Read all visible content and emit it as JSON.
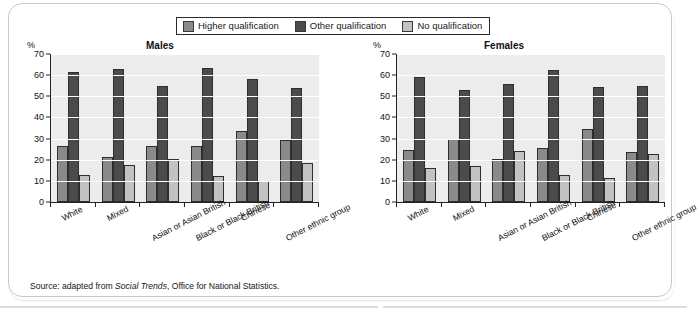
{
  "legend": {
    "items": [
      {
        "label": "Higher qualification",
        "color": "#8a8a8a",
        "key": "higher"
      },
      {
        "label": "Other qualification",
        "color": "#4b4b4b",
        "key": "other"
      },
      {
        "label": "No qualification",
        "color": "#c2c2c2",
        "key": "none"
      }
    ]
  },
  "axis": {
    "unit": "%",
    "ticks": [
      "70",
      "60",
      "50",
      "40",
      "30",
      "20",
      "10",
      "0"
    ]
  },
  "panels": [
    {
      "title": "Males",
      "unit": "%"
    },
    {
      "title": "Females",
      "unit": "%"
    }
  ],
  "source": {
    "prefix": "Source: adapted from ",
    "italic": "Social Trends",
    "suffix": ", Office for National Statistics."
  },
  "chart_data": {
    "type": "bar",
    "xlabel": "",
    "ylabel": "%",
    "ylim": [
      0,
      70
    ],
    "yticks": [
      0,
      10,
      20,
      30,
      40,
      50,
      60,
      70
    ],
    "grid": true,
    "legend_position": "top-center",
    "categories": [
      "White",
      "Mixed",
      "Asian or Asian British",
      "Black or Black British",
      "Chinese",
      "Other ethnic group"
    ],
    "panels": [
      {
        "name": "Males",
        "series": [
          {
            "name": "Higher qualification",
            "color": "#8a8a8a",
            "values": [
              26.5,
              21.5,
              26.5,
              26.5,
              33.5,
              29.5
            ]
          },
          {
            "name": "Other qualification",
            "color": "#4b4b4b",
            "values": [
              61.5,
              63.0,
              55.0,
              63.5,
              58.0,
              54.0
            ]
          },
          {
            "name": "No qualification",
            "color": "#c2c2c2",
            "values": [
              13.0,
              17.5,
              20.5,
              12.5,
              10.0,
              18.5
            ]
          }
        ]
      },
      {
        "name": "Females",
        "series": [
          {
            "name": "Higher qualification",
            "color": "#8a8a8a",
            "values": [
              24.8,
              30.0,
              20.3,
              25.5,
              34.5,
              23.8
            ]
          },
          {
            "name": "Other qualification",
            "color": "#4b4b4b",
            "values": [
              59.0,
              53.0,
              56.0,
              62.5,
              54.5,
              55.0
            ]
          },
          {
            "name": "No qualification",
            "color": "#c2c2c2",
            "values": [
              16.0,
              16.8,
              24.2,
              12.8,
              11.2,
              22.8
            ]
          }
        ]
      }
    ]
  }
}
